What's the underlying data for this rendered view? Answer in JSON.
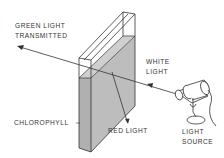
{
  "diagram": {
    "labels": {
      "green_light_line1": "GREEN LIGHT",
      "green_light_line2": "TRANSMITTED",
      "white_light_line1": "WHITE",
      "white_light_line2": "LIGHT",
      "chlorophyll": "CHLOROPHYLL",
      "red_light": "RED LIGHT",
      "light_source_line1": "LIGHT",
      "light_source_line2": "SOURCE"
    },
    "colors": {
      "line": "#333333",
      "liquid_fill": "#bcbcbc",
      "liquid_side_fill": "#a8a8a8",
      "glass_fill": "#ffffff",
      "text": "#333333"
    }
  }
}
